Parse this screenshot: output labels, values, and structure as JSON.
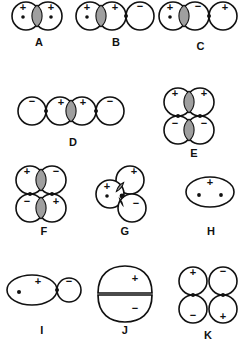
{
  "figure": {
    "background_color": "#ffffff",
    "line_color": "#111111",
    "overlap_shade_color": "#9f9f9f",
    "panel_count": 11
  },
  "symbols": {
    "plus": "+",
    "minus": "−"
  },
  "panels": [
    {
      "id": "A",
      "label": "A",
      "arrangement": "two overlapping circles, horizontal",
      "circle_count": 2,
      "signs": [
        "+",
        "+"
      ],
      "nuclei": 2,
      "shaded_overlaps": 1,
      "tangent_contacts": 0
    },
    {
      "id": "B",
      "label": "B",
      "arrangement": "three circles in a row, horizontal",
      "circle_count": 3,
      "signs": [
        "+",
        "+",
        "−"
      ],
      "nuclei": 1,
      "shaded_overlaps": 1,
      "tangent_contacts": 1
    },
    {
      "id": "C",
      "label": "C",
      "arrangement": "three circles in a row, horizontal",
      "circle_count": 3,
      "signs": [
        "+",
        "−",
        "+"
      ],
      "nuclei": 1,
      "shaded_overlaps": 1,
      "tangent_contacts": 1
    },
    {
      "id": "D",
      "label": "D",
      "arrangement": "four circles in a row, horizontal",
      "circle_count": 4,
      "signs": [
        "−",
        "+",
        "+",
        "−"
      ],
      "nuclei": 0,
      "shaded_overlaps": 1,
      "tangent_contacts": 2
    },
    {
      "id": "E",
      "label": "E",
      "arrangement": "two-by-two grid, rows overlap horizontally",
      "circle_count": 4,
      "signs": [
        "+",
        "+",
        "−",
        "−"
      ],
      "nuclei": 0,
      "shaded_overlaps": 2,
      "tangent_contacts": 2
    },
    {
      "id": "F",
      "label": "F",
      "arrangement": "two-by-two grid, rows overlap horizontally",
      "circle_count": 4,
      "signs": [
        "+",
        "−",
        "−",
        "+"
      ],
      "nuclei": 0,
      "shaded_overlaps": 2,
      "tangent_contacts": 2
    },
    {
      "id": "G",
      "label": "G",
      "arrangement": "three circles, triangular cluster",
      "circle_count": 3,
      "signs": [
        "+",
        "+",
        "−"
      ],
      "nuclei": 1,
      "shaded_overlaps": 2,
      "tangent_contacts": 1
    },
    {
      "id": "H",
      "label": "H",
      "arrangement": "single wide ellipse",
      "circle_count": 1,
      "signs": [
        "+"
      ],
      "nuclei": 2,
      "shaded_overlaps": 0,
      "tangent_contacts": 0
    },
    {
      "id": "I",
      "label": "I",
      "arrangement": "large ellipse tangent to small circle",
      "circle_count": 2,
      "signs": [
        "+",
        "−"
      ],
      "nuclei": 1,
      "shaded_overlaps": 0,
      "tangent_contacts": 1
    },
    {
      "id": "J",
      "label": "J",
      "arrangement": "two flattened lobes stacked vertically",
      "circle_count": 2,
      "signs": [
        "+",
        "−"
      ],
      "nuclei": 0,
      "shaded_overlaps": 0,
      "tangent_contacts": 1
    },
    {
      "id": "K",
      "label": "K",
      "arrangement": "two-by-two grid of tangent circles",
      "circle_count": 4,
      "signs": [
        "+",
        "−",
        "−",
        "+"
      ],
      "nuclei": 0,
      "shaded_overlaps": 0,
      "tangent_contacts": 4
    }
  ]
}
